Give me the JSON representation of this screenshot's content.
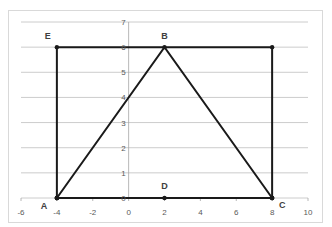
{
  "chart_data": {
    "type": "scatter",
    "title": "",
    "xlabel": "",
    "ylabel": "",
    "xlim": [
      -6,
      10
    ],
    "ylim": [
      0,
      7
    ],
    "x_ticks": [
      -6,
      -4,
      -2,
      0,
      2,
      4,
      6,
      8,
      10
    ],
    "y_ticks": [
      0,
      1,
      2,
      3,
      4,
      5,
      6,
      7
    ],
    "grid": {
      "horizontal": true,
      "vertical": false
    },
    "legend": "none",
    "series": [
      {
        "name": "Rectangle",
        "points": [
          [
            -4,
            0
          ],
          [
            -4,
            6
          ],
          [
            8,
            6
          ],
          [
            8,
            0
          ],
          [
            -4,
            0
          ]
        ]
      },
      {
        "name": "Triangle",
        "points": [
          [
            -4,
            0
          ],
          [
            2,
            6
          ],
          [
            8,
            0
          ]
        ]
      },
      {
        "name": "Base",
        "points": [
          [
            -4,
            0
          ],
          [
            2,
            0
          ],
          [
            8,
            0
          ]
        ]
      }
    ],
    "annotations": [
      {
        "label": "A",
        "x": -4,
        "y": 0
      },
      {
        "label": "B",
        "x": 2,
        "y": 6
      },
      {
        "label": "C",
        "x": 8,
        "y": 0
      },
      {
        "label": "D",
        "x": 2,
        "y": 0
      },
      {
        "label": "E",
        "x": -4,
        "y": 6
      }
    ]
  },
  "colors": {
    "line": "#1a1a1a",
    "grid": "#bfbfbf",
    "axis": "#a6a6a6",
    "frame": "#d9d9d9",
    "tick_text": "#595959"
  }
}
